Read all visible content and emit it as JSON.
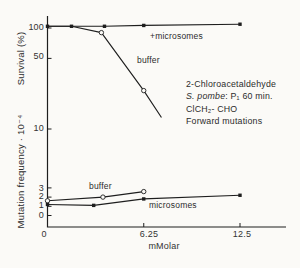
{
  "figure": {
    "background_color": "#fbfaf7",
    "ink_color": "#1e1e1e",
    "survival_axis_label": "Survival (%)",
    "mutation_axis_label": "Mutation frequency · 10⁻⁴",
    "x_axis_label": "mMolar",
    "survival_tick_labels": [
      "100",
      "50",
      "10"
    ],
    "mutation_tick_labels": [
      "3",
      "2",
      "1",
      "0"
    ],
    "x_tick_labels": [
      "0",
      "6.25",
      "12.5"
    ],
    "curve_labels": {
      "survival_plus_microsomes": "+microsomes",
      "survival_buffer": "buffer",
      "mutation_buffer": "buffer",
      "mutation_microsomes": "microsomes"
    },
    "annotation": {
      "line1": "2-Chloroacetaldehyde",
      "line2_italic": "S. pombe",
      "line2_rest": ": P₁ 60 min.",
      "line3": "ClCH₂- CHO",
      "line4": "Forward mutations"
    }
  },
  "chart_data": {
    "type": "line",
    "title": "",
    "xlabel": "mMolar",
    "x_ticks": [
      0,
      6.25,
      12.5
    ],
    "axes": {
      "survival": {
        "label": "Survival (%)",
        "scale": "log",
        "ticks": [
          100,
          50,
          10
        ],
        "range": [
          10,
          130
        ]
      },
      "mutation": {
        "label": "Mutation frequency ·10⁻⁴",
        "scale": "linear",
        "ticks": [
          3,
          2,
          1,
          0
        ],
        "range": [
          0,
          3.2
        ]
      }
    },
    "legend_position": "inline-labels",
    "grid": false,
    "series": [
      {
        "name": "survival-plus-microsomes",
        "label": "+microsomes",
        "axis": "survival",
        "marker": "square",
        "x": [
          0,
          1.56,
          3.7,
          6.25,
          12.5
        ],
        "y": [
          104,
          104,
          104,
          106,
          109
        ]
      },
      {
        "name": "survival-buffer",
        "label": "buffer",
        "axis": "survival",
        "marker": "circle",
        "marker_indices": [
          2,
          3
        ],
        "x": [
          0,
          1.56,
          3.5,
          6.25,
          7.4
        ],
        "y": [
          104,
          104,
          90,
          24,
          13
        ]
      },
      {
        "name": "mutation-buffer",
        "label": "buffer",
        "axis": "mutation",
        "marker": "circle",
        "x": [
          0,
          3.6,
          6.25
        ],
        "y": [
          1.6,
          2.0,
          2.6
        ]
      },
      {
        "name": "mutation-microsomes",
        "label": "microsomes",
        "axis": "mutation",
        "marker": "square",
        "x": [
          0,
          3.0,
          6.25,
          12.5
        ],
        "y": [
          1.2,
          1.1,
          1.8,
          2.2
        ]
      }
    ],
    "layout": {
      "x0_px": 47.5,
      "px_per_mM": 15.4,
      "survival_y100_px": 28,
      "px_per_decade": 101,
      "mutation_y0_px": 215.5,
      "px_per_mut_unit": 9.2,
      "axis_top_px": 16,
      "axis_bottom_px": 227,
      "axis_right_px": 286,
      "tick_len_px": 4
    }
  }
}
